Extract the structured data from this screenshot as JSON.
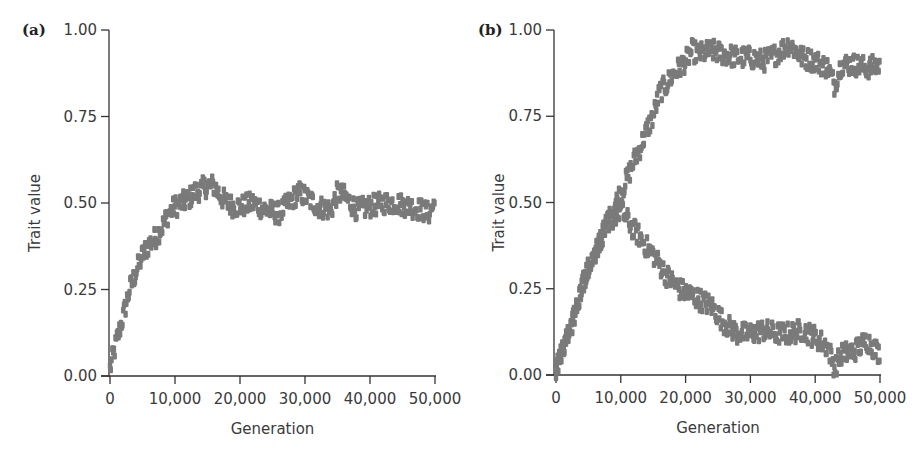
{
  "chart_data": [
    {
      "panel_label": "(a)",
      "type": "scatter",
      "title": "",
      "xlabel": "Generation",
      "ylabel": "Trait value",
      "xlim": [
        0,
        50000
      ],
      "ylim": [
        0,
        1
      ],
      "xticks": [
        "0",
        "10,000",
        "20,000",
        "30,000",
        "40,000",
        "50,000"
      ],
      "yticks": [
        "0.00",
        "0.25",
        "0.50",
        "0.75",
        "1.00"
      ],
      "grid": false,
      "marker_color": "#7a7a7a",
      "series": [
        {
          "name": "trait",
          "x": [
            0,
            1000,
            2000,
            3000,
            4000,
            5000,
            6000,
            7000,
            8000,
            9000,
            10000,
            11000,
            12000,
            13000,
            14000,
            15000,
            16000,
            17000,
            18000,
            19000,
            20000,
            22000,
            24000,
            26000,
            28000,
            29000,
            30000,
            32000,
            34000,
            35000,
            36000,
            38000,
            40000,
            42000,
            44000,
            46000,
            48000,
            49000,
            50000
          ],
          "y": [
            0.02,
            0.1,
            0.17,
            0.25,
            0.3,
            0.35,
            0.38,
            0.4,
            0.43,
            0.47,
            0.49,
            0.5,
            0.51,
            0.53,
            0.54,
            0.55,
            0.55,
            0.52,
            0.5,
            0.49,
            0.49,
            0.5,
            0.48,
            0.47,
            0.51,
            0.53,
            0.52,
            0.49,
            0.48,
            0.53,
            0.52,
            0.48,
            0.49,
            0.5,
            0.5,
            0.49,
            0.48,
            0.47,
            0.5
          ]
        }
      ]
    },
    {
      "panel_label": "(b)",
      "type": "scatter",
      "title": "",
      "xlabel": "Generation",
      "ylabel": "Trait value",
      "xlim": [
        0,
        50000
      ],
      "ylim": [
        0,
        1
      ],
      "xticks": [
        "0",
        "10,000",
        "20,000",
        "30,000",
        "40,000",
        "50,000"
      ],
      "yticks": [
        "0.00",
        "0.25",
        "0.50",
        "0.75",
        "1.00"
      ],
      "grid": false,
      "marker_color": "#7a7a7a",
      "series": [
        {
          "name": "upper branch",
          "x": [
            0,
            1000,
            2000,
            3000,
            4000,
            5000,
            6000,
            7000,
            8000,
            9000,
            10000,
            11000,
            12000,
            13000,
            14000,
            15000,
            16000,
            17000,
            18000,
            19000,
            20000,
            21000,
            22000,
            24000,
            26000,
            28000,
            30000,
            32000,
            34000,
            36000,
            38000,
            40000,
            42000,
            43000,
            44000,
            46000,
            48000,
            50000
          ],
          "y": [
            0.02,
            0.07,
            0.12,
            0.18,
            0.26,
            0.31,
            0.35,
            0.4,
            0.44,
            0.49,
            0.53,
            0.57,
            0.62,
            0.66,
            0.71,
            0.75,
            0.82,
            0.84,
            0.87,
            0.89,
            0.91,
            0.94,
            0.93,
            0.94,
            0.93,
            0.92,
            0.92,
            0.91,
            0.93,
            0.96,
            0.92,
            0.91,
            0.89,
            0.84,
            0.9,
            0.9,
            0.89,
            0.9
          ]
        },
        {
          "name": "lower branch",
          "x": [
            0,
            1000,
            2000,
            3000,
            4000,
            5000,
            6000,
            7000,
            8000,
            9000,
            10000,
            11000,
            12000,
            13000,
            14000,
            15000,
            16000,
            17000,
            18000,
            19000,
            20000,
            22000,
            24000,
            26000,
            28000,
            30000,
            32000,
            34000,
            36000,
            38000,
            40000,
            42000,
            43000,
            44000,
            46000,
            48000,
            50000
          ],
          "y": [
            0.02,
            0.07,
            0.12,
            0.18,
            0.26,
            0.31,
            0.35,
            0.4,
            0.44,
            0.46,
            0.48,
            0.45,
            0.42,
            0.4,
            0.37,
            0.35,
            0.32,
            0.29,
            0.27,
            0.25,
            0.24,
            0.22,
            0.2,
            0.15,
            0.12,
            0.12,
            0.13,
            0.12,
            0.12,
            0.13,
            0.11,
            0.08,
            0.02,
            0.06,
            0.07,
            0.1,
            0.06
          ]
        }
      ]
    }
  ]
}
